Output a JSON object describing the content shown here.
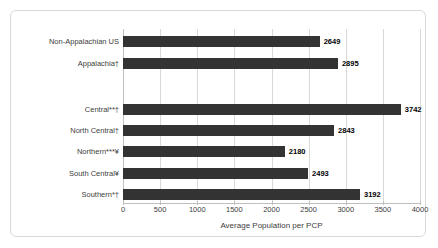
{
  "chart_data": {
    "type": "bar",
    "orientation": "horizontal",
    "title": "",
    "xlabel": "Average Population per PCP",
    "ylabel": "",
    "xlim": [
      0,
      4000
    ],
    "xticks": [
      0,
      500,
      1000,
      1500,
      2000,
      2500,
      3000,
      3500,
      4000
    ],
    "grid": true,
    "legend": "none",
    "bar_color": "#333333",
    "categories": [
      "Non-Appalachian US",
      "Appalachia†",
      "",
      "Central**†",
      "North Central†",
      "Northern***¥",
      "South Central¥",
      "Southern*†"
    ],
    "values": [
      2649,
      2895,
      null,
      3742,
      2843,
      2180,
      2493,
      3192
    ],
    "data_labels": [
      "2649",
      "2895",
      "",
      "3742",
      "2843",
      "2180",
      "2493",
      "3192"
    ],
    "bars": [
      {
        "label": "Non-Appalachian US",
        "value": 2649,
        "value_text": "2649"
      },
      {
        "label": "Appalachia†",
        "value": 2895,
        "value_text": "2895"
      },
      {
        "label": "Central**†",
        "value": 3742,
        "value_text": "3742"
      },
      {
        "label": "North Central†",
        "value": 2843,
        "value_text": "2843"
      },
      {
        "label": "Northern***¥",
        "value": 2180,
        "value_text": "2180"
      },
      {
        "label": "South Central¥",
        "value": 2493,
        "value_text": "2493"
      },
      {
        "label": "Southern*†",
        "value": 3192,
        "value_text": "3192"
      }
    ],
    "tick_text": [
      "0",
      "500",
      "1000",
      "1500",
      "2000",
      "2500",
      "3000",
      "3500",
      "4000"
    ]
  }
}
